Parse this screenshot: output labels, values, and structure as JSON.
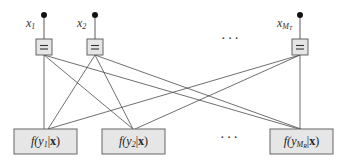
{
  "diagram": {
    "type": "factor-graph",
    "variables": [
      {
        "id": "x1",
        "label": "x",
        "sub": "1",
        "dot": [
          44,
          15
        ],
        "eqbox": [
          36,
          39,
          16,
          16
        ]
      },
      {
        "id": "x2",
        "label": "x",
        "sub": "2",
        "dot": [
          95,
          15
        ],
        "eqbox": [
          87,
          39,
          16,
          16
        ]
      },
      {
        "id": "xMT",
        "label": "x",
        "sub": "M",
        "subsub": "T",
        "dot": [
          300,
          15
        ],
        "eqbox": [
          292,
          39,
          16,
          16
        ]
      }
    ],
    "equality_symbol": "=",
    "factors": [
      {
        "id": "f1",
        "func": "f",
        "var": "y",
        "sub": "1",
        "cond": "x",
        "box": [
          14,
          129,
          63,
          25
        ]
      },
      {
        "id": "f2",
        "func": "f",
        "var": "y",
        "sub": "2",
        "cond": "x",
        "box": [
          102,
          129,
          63,
          25
        ]
      },
      {
        "id": "fMR",
        "func": "f",
        "var": "y",
        "sub": "M",
        "subsub": "R",
        "cond": "x",
        "box": [
          270,
          129,
          63,
          25
        ]
      }
    ],
    "edges": [
      [
        "x1",
        "f1"
      ],
      [
        "x1",
        "f2"
      ],
      [
        "x1",
        "fMR"
      ],
      [
        "x2",
        "f1"
      ],
      [
        "x2",
        "f2"
      ],
      [
        "x2",
        "fMR"
      ],
      [
        "xMT",
        "f1"
      ],
      [
        "xMT",
        "f2"
      ],
      [
        "xMT",
        "fMR"
      ]
    ],
    "ellipsis_top": "···",
    "ellipsis_bottom": "···"
  },
  "labels": {
    "x1": "x",
    "x1_sub": "1",
    "x2": "x",
    "x2_sub": "2",
    "xMT": "x",
    "xMT_sub": "M",
    "xMT_subsub": "T",
    "eq": "=",
    "f1_func": "f(",
    "f1_var": "y",
    "f1_sub": "1",
    "f1_bar": "|",
    "f1_cond": "x",
    "f1_close": ")",
    "f2_func": "f(",
    "f2_var": "y",
    "f2_sub": "2",
    "f2_bar": "|",
    "f2_cond": "x",
    "f2_close": ")",
    "fMR_func": "f(",
    "fMR_var": "y",
    "fMR_sub": "M",
    "fMR_subsub": "R",
    "fMR_bar": "|",
    "fMR_cond": "x",
    "fMR_close": ")",
    "ellipsis_top": "···",
    "ellipsis_bottom": "···"
  }
}
